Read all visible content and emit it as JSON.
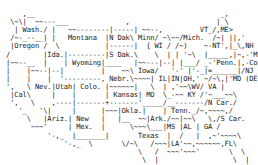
{
  "map": {
    "lines": [
      "                                                          ",
      "     ,__                                             _,    ",
      "  \\~\\|  ~~---___              ,                     | \\   ",
      "   | Wash./ |   ~~--------|-----| ~~--,         VT_/,ME>  ",
      "  /~-_--__| |   Montana  |N Dak\\ Minn/ ~\\~~/Mich.  /~| ||,'",
      "  |Oregon /  \\           |------|  { WI / /~)    ~-NT',|_\\,NH",
      " /        |Ida.|---------|S Dak.\\    \\  | | '~\\  |_____,|~,-'Mass.",
      " |~~--__  |    | Wyoming|____   |~~---|--| |___/ _-'Penn.|,-Conn (RI)",
      " |    |~~--|--|         |    ~~\\ Iowa/   '-' |'-_|=______|/NJ",
      " |    |    |  '---------, Nebr.\\~~~~| IL|IN|OH,' ~/~\\,|'MD (DE)",
      " ',   \\ Nev.|Utah| Colo. |~~~~~~|   \\  | ,'~~\\WV/ VA |",
      "  |Cal\\     |    |       | Kansas| MO  \\_-~~ KY /'~___~~\\",
      "  ',   \\    ,----|-------+-------'_____/__-------/N Car./",
      "    '_   '\\|     |      |~~~|Okla.|    | Tenn._/~,~~~~,/",
      "      \\   |Ariz.| New   |   |__  ~~|Ark./~~|~~\\   \\,/S Car.",
      "       ~~~'     | Mex.  |      \\~~~\\___|MS |AL | GA /",
      "           '-,_  |_______|       Texas  |  /   |  ,~'~~~~\\",
      "               '-,_  \\       \\/~\\   /~~~|LA'~~,~~~~~~,FL\\",
      "                                 \\   /  ~~~'~~~'       \\  \\",
      "                                  \\  |                  \\  |",
      "                                   '~'                   '\\|'"
    ],
    "state_labels": [
      "Wash.",
      "Oregon",
      "Cal",
      "Nev.",
      "Ida.",
      "Montana",
      "Wyoming",
      "Utah",
      "Colo.",
      "Ariz.",
      "New Mex.",
      "N Dak",
      "S Dak.",
      "Nebr.",
      "Kansas",
      "Okla.",
      "Texas",
      "Minn",
      "Iowa",
      "MO",
      "Ark.",
      "LA",
      "WI",
      "IL",
      "IN",
      "OH",
      "Mich.",
      "KY",
      "Tenn.",
      "MS",
      "AL",
      "GA",
      "FL",
      "S Car.",
      "N Car.",
      "VA",
      "WV",
      "MD",
      "DE",
      "Penn.",
      "NJ",
      "NT",
      "Conn",
      "RI",
      "Mass.",
      "VT",
      "NH",
      "ME"
    ]
  }
}
